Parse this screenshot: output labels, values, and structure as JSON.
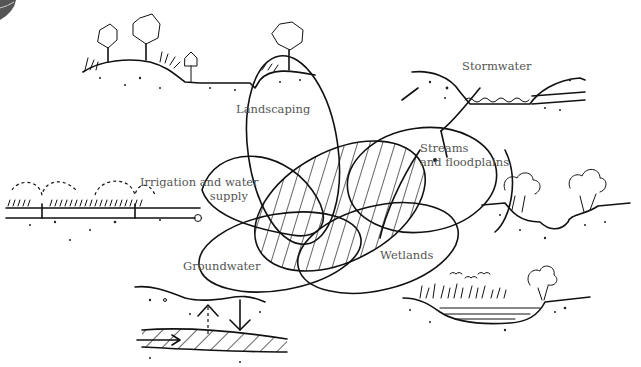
{
  "diagram": {
    "type": "overlapping-ellipses-illustration",
    "center_element": "hatched central ellipse overlapping five outlined ellipses",
    "labels": [
      {
        "id": "landscaping",
        "text": "Landscaping"
      },
      {
        "id": "stormwater",
        "text": "Stormwater"
      },
      {
        "id": "streams",
        "text_line1": "Streams",
        "text_line2": "and floodplains"
      },
      {
        "id": "irrigation",
        "text_line1": "Irrigation and water",
        "text_line2": "supply"
      },
      {
        "id": "groundwater",
        "text": "Groundwater"
      },
      {
        "id": "wetlands",
        "text": "Wetlands"
      }
    ],
    "vignettes": [
      {
        "id": "landscaping-scene",
        "depicts": "hill with trees, shrubs and birdhouse sign"
      },
      {
        "id": "stormwater-scene",
        "depicts": "channel with water and culvert pipe"
      },
      {
        "id": "irrigation-scene",
        "depicts": "lawn with sprinklers and buried pipe"
      },
      {
        "id": "streams-scene",
        "depicts": "stream bed with trees on banks"
      },
      {
        "id": "groundwater-scene",
        "depicts": "soil layer with aquifer and up/down arrows"
      },
      {
        "id": "wetlands-scene",
        "depicts": "marsh with reeds, water, tree and birds"
      }
    ],
    "colors": {
      "ink": "#111111",
      "label": "#555555",
      "background": "#ffffff"
    }
  }
}
